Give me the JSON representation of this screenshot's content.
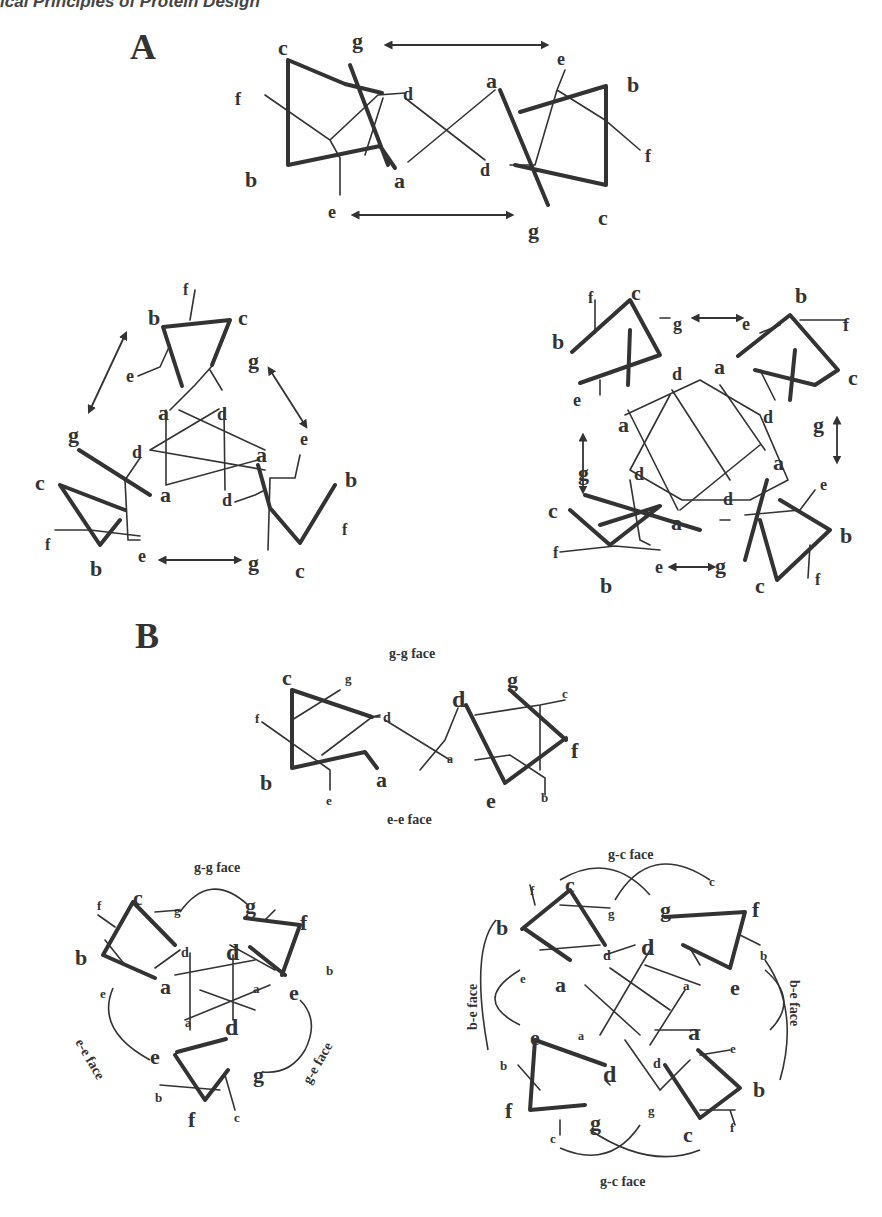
{
  "header": {
    "running_title": "ical Principles of Protein Design"
  },
  "panels": {
    "A": {
      "label": "A",
      "dimer": {
        "labels": [
          "c",
          "g",
          "f",
          "d",
          "a",
          "e",
          "b",
          "b",
          "a",
          "d",
          "f",
          "e",
          "g",
          "c"
        ]
      },
      "trimer": {
        "labels": [
          "f",
          "b",
          "c",
          "g",
          "e",
          "a",
          "d",
          "g",
          "e",
          "d",
          "a",
          "c",
          "b",
          "f",
          "a",
          "d",
          "b",
          "e",
          "g",
          "c",
          "f"
        ]
      },
      "tetramer": {
        "labels": [
          "f",
          "c",
          "b",
          "g",
          "e",
          "b",
          "f",
          "d",
          "a",
          "c",
          "e",
          "a",
          "d",
          "g",
          "g",
          "d",
          "a",
          "c",
          "e",
          "a",
          "d",
          "b",
          "f",
          "b",
          "e",
          "g",
          "c",
          "f"
        ]
      }
    },
    "B": {
      "label": "B",
      "dimer": {
        "face_top": "g-g face",
        "face_bottom": "e-e face"
      },
      "trimer": {
        "face_top": "g-g face",
        "face_left": "e-e face",
        "face_right": "g-e face"
      },
      "tetramer": {
        "face_top": "g-c face",
        "face_bottom": "g-c face",
        "face_left": "b-e face",
        "face_right": "b-e face"
      }
    }
  }
}
